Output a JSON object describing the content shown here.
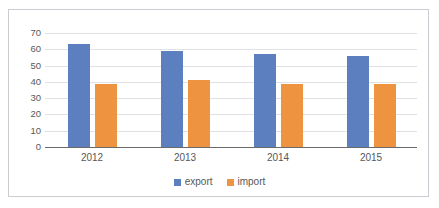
{
  "chart_data": {
    "type": "bar",
    "title": "",
    "xlabel": "",
    "ylabel": "",
    "categories": [
      "2012",
      "2013",
      "2014",
      "2015"
    ],
    "series": [
      {
        "name": "export",
        "color": "#5b7fbf",
        "values": [
          63,
          59,
          57,
          56
        ]
      },
      {
        "name": "import",
        "color": "#ee9440",
        "values": [
          39,
          41,
          39,
          39
        ]
      }
    ],
    "ylim": [
      0,
      70
    ],
    "ytick_step": 10,
    "yticks": [
      70,
      60,
      50,
      40,
      30,
      20,
      10,
      0
    ],
    "grid": true,
    "legend_position": "bottom",
    "annotations": []
  },
  "legend": {
    "items": [
      {
        "label": "export",
        "color": "#5b7fbf"
      },
      {
        "label": "import",
        "color": "#ee9440"
      }
    ]
  },
  "axis": {
    "y_labels": [
      "70",
      "60",
      "50",
      "40",
      "30",
      "20",
      "10",
      "0"
    ],
    "x_labels": [
      "2012",
      "2013",
      "2014",
      "2015"
    ]
  },
  "colors": {
    "export": "#5b7fbf",
    "import": "#ee9440",
    "gridline": "#dfe1e4",
    "axis": "#6a6a6a",
    "border": "#c9ccd1",
    "text": "#585858",
    "background": "#ffffff"
  }
}
